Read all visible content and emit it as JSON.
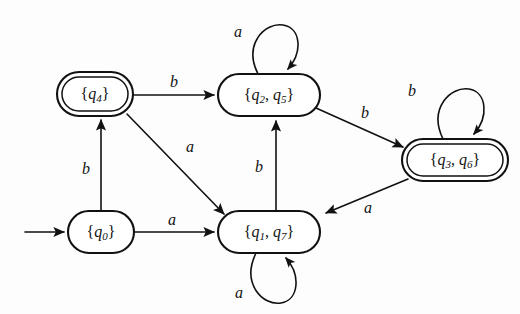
{
  "figure": {
    "kind": "finite-automaton-state-diagram",
    "background_color": "#fdfdfd",
    "ink_color": "#111111",
    "width": 520,
    "height": 314
  },
  "alphabet": [
    "a",
    "b"
  ],
  "start_state": "{q0}",
  "nodes": [
    {
      "id": "q4",
      "label": "{q4}",
      "label_base": "q",
      "label_sub": "4",
      "accepting": true,
      "start": false,
      "cx": 95,
      "cy": 94,
      "rx": 38,
      "ry": 22
    },
    {
      "id": "q2q5",
      "label": "{q2, q5}",
      "label_base": "q",
      "label_sub": "2",
      "label_base2": "q",
      "label_sub2": "5",
      "accepting": false,
      "start": false,
      "cx": 269,
      "cy": 95,
      "rx": 51,
      "ry": 21
    },
    {
      "id": "q3q6",
      "label": "{q3, q6}",
      "label_base": "q",
      "label_sub": "3",
      "label_base2": "q",
      "label_sub2": "6",
      "accepting": true,
      "start": false,
      "cx": 455,
      "cy": 160,
      "rx": 53,
      "ry": 21
    },
    {
      "id": "q0",
      "label": "{q0}",
      "label_base": "q",
      "label_sub": "0",
      "accepting": false,
      "start": true,
      "cx": 101,
      "cy": 232,
      "rx": 33,
      "ry": 21
    },
    {
      "id": "q1q7",
      "label": "{q1, q7}",
      "label_base": "q",
      "label_sub": "1",
      "label_base2": "q",
      "label_sub2": "7",
      "accepting": false,
      "start": false,
      "cx": 269,
      "cy": 232,
      "rx": 51,
      "ry": 21
    }
  ],
  "edges": [
    {
      "id": "start-arrow",
      "from": "",
      "to": "q0",
      "label": "",
      "kind": "start"
    },
    {
      "id": "q0-b-q4",
      "from": "q0",
      "to": "q4",
      "label": "b",
      "kind": "straight",
      "label_x": 86,
      "label_y": 170
    },
    {
      "id": "q0-a-q1q7",
      "from": "q0",
      "to": "q1q7",
      "label": "a",
      "kind": "straight",
      "label_x": 172,
      "label_y": 221
    },
    {
      "id": "q4-b-q2q5",
      "from": "q4",
      "to": "q2q5",
      "label": "b",
      "kind": "straight",
      "label_x": 174,
      "label_y": 83
    },
    {
      "id": "q4-a-q1q7",
      "from": "q4",
      "to": "q1q7",
      "label": "a",
      "kind": "straight",
      "label_x": 190,
      "label_y": 148
    },
    {
      "id": "q1q7-b-q2q5",
      "from": "q1q7",
      "to": "q2q5",
      "label": "b",
      "kind": "straight",
      "label_x": 259,
      "label_y": 168
    },
    {
      "id": "q2q5-a-loop",
      "from": "q2q5",
      "to": "q2q5",
      "label": "a",
      "kind": "self-loop-top",
      "label_x": 238,
      "label_y": 33
    },
    {
      "id": "q2q5-b-q3q6",
      "from": "q2q5",
      "to": "q3q6",
      "label": "b",
      "kind": "straight",
      "label_x": 365,
      "label_y": 114
    },
    {
      "id": "q3q6-b-loop",
      "from": "q3q6",
      "to": "q3q6",
      "label": "b",
      "kind": "self-loop-top",
      "label_x": 412,
      "label_y": 92
    },
    {
      "id": "q3q6-a-q1q7",
      "from": "q3q6",
      "to": "q1q7",
      "label": "a",
      "kind": "straight",
      "label_x": 368,
      "label_y": 209
    },
    {
      "id": "q1q7-a-loop",
      "from": "q1q7",
      "to": "q1q7",
      "label": "a",
      "kind": "self-loop-bottom",
      "label_x": 239,
      "label_y": 294
    }
  ]
}
